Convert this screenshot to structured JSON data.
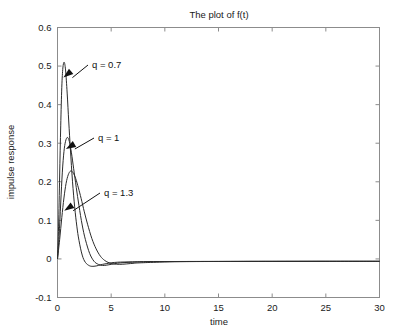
{
  "chart_data": {
    "type": "line",
    "title": "The plot of f(t)",
    "xlabel": "time",
    "ylabel": "impulse response",
    "xlim": [
      0,
      30
    ],
    "ylim": [
      -0.1,
      0.6
    ],
    "xticks": [
      "0",
      "5",
      "10",
      "15",
      "20",
      "25",
      "30"
    ],
    "xtick_values": [
      0,
      5,
      10,
      15,
      20,
      25,
      30
    ],
    "yticks": [
      "-0.1",
      "0",
      "0.1",
      "0.2",
      "0.3",
      "0.4",
      "0.5",
      "0.6"
    ],
    "ytick_values": [
      -0.1,
      0,
      0.1,
      0.2,
      0.3,
      0.4,
      0.5,
      0.6
    ],
    "grid": false,
    "legend_position": "none",
    "annotations": [
      {
        "text": "q = 0.7",
        "points_to_x": 0.55,
        "points_to_y": 0.47
      },
      {
        "text": "q = 1",
        "points_to_x": 0.78,
        "points_to_y": 0.285
      },
      {
        "text": "q = 1.3",
        "points_to_x": 0.62,
        "points_to_y": 0.125
      }
    ],
    "series": [
      {
        "name": "q = 0.7",
        "color": "#2b2b2b",
        "peak_time": 0.62,
        "peak_value": 0.51,
        "x": [
          0,
          0.1,
          0.2,
          0.3,
          0.4,
          0.5,
          0.62,
          0.75,
          0.9,
          1.05,
          1.2,
          1.4,
          1.6,
          1.8,
          2.0,
          2.3,
          2.6,
          3.0,
          3.4,
          3.8,
          4.2,
          4.6,
          5.0,
          5.6,
          6.2,
          7.0,
          8.0,
          10.0,
          12.0,
          15.0,
          20.0,
          25.0,
          30.0
        ],
        "y": [
          0.0,
          0.085,
          0.215,
          0.345,
          0.445,
          0.495,
          0.51,
          0.49,
          0.43,
          0.355,
          0.285,
          0.2,
          0.135,
          0.085,
          0.048,
          0.01,
          -0.009,
          -0.018,
          -0.019,
          -0.017,
          -0.014,
          -0.012,
          -0.01,
          -0.0085,
          -0.008,
          -0.0075,
          -0.007,
          -0.0068,
          -0.0066,
          -0.0065,
          -0.0063,
          -0.0062,
          -0.0062
        ]
      },
      {
        "name": "q = 1",
        "color": "#9a9a9a",
        "peak_time": 0.92,
        "peak_value": 0.315,
        "x": [
          0,
          0.15,
          0.3,
          0.45,
          0.6,
          0.75,
          0.92,
          1.1,
          1.3,
          1.5,
          1.75,
          2.0,
          2.3,
          2.6,
          3.0,
          3.4,
          3.8,
          4.2,
          4.6,
          5.0,
          5.6,
          6.2,
          7.0,
          8.0,
          10.0,
          12.0,
          15.0,
          20.0,
          25.0,
          30.0
        ],
        "y": [
          0.0,
          0.06,
          0.145,
          0.225,
          0.278,
          0.305,
          0.315,
          0.305,
          0.275,
          0.235,
          0.185,
          0.138,
          0.088,
          0.05,
          0.014,
          -0.006,
          -0.014,
          -0.017,
          -0.016,
          -0.014,
          -0.011,
          -0.0095,
          -0.0085,
          -0.0078,
          -0.007,
          -0.0067,
          -0.0065,
          -0.0063,
          -0.0062,
          -0.0062
        ]
      },
      {
        "name": "q = 1.3",
        "color": "#2b2b2b",
        "peak_time": 1.22,
        "peak_value": 0.228,
        "x": [
          0,
          0.2,
          0.4,
          0.6,
          0.8,
          1.0,
          1.22,
          1.45,
          1.7,
          1.95,
          2.2,
          2.5,
          2.8,
          3.2,
          3.6,
          4.0,
          4.4,
          4.8,
          5.2,
          5.8,
          6.4,
          7.2,
          8.0,
          10.0,
          12.0,
          15.0,
          20.0,
          25.0,
          30.0
        ],
        "y": [
          0.0,
          0.05,
          0.107,
          0.158,
          0.196,
          0.218,
          0.228,
          0.224,
          0.208,
          0.184,
          0.157,
          0.122,
          0.09,
          0.053,
          0.026,
          0.007,
          -0.004,
          -0.01,
          -0.013,
          -0.014,
          -0.013,
          -0.011,
          -0.0098,
          -0.0078,
          -0.007,
          -0.0066,
          -0.0063,
          -0.0062,
          -0.0062
        ]
      }
    ]
  }
}
